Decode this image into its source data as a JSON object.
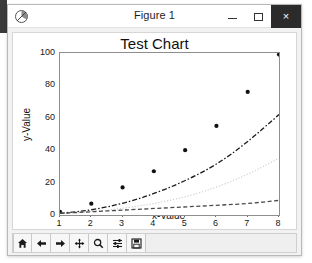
{
  "window": {
    "title": "Figure 1",
    "app_icon": "matplotlib-icon",
    "minimize_label": "",
    "maximize_label": "",
    "close_label": "×"
  },
  "toolbar": {
    "buttons": [
      {
        "name": "home-button",
        "icon": "home-icon",
        "tooltip": "Home"
      },
      {
        "name": "back-button",
        "icon": "arrow-left-icon",
        "tooltip": "Back"
      },
      {
        "name": "forward-button",
        "icon": "arrow-right-icon",
        "tooltip": "Forward"
      },
      {
        "name": "pan-button",
        "icon": "move-icon",
        "tooltip": "Pan"
      },
      {
        "name": "zoom-button",
        "icon": "magnifier-icon",
        "tooltip": "Zoom"
      },
      {
        "name": "configure-subplots-button",
        "icon": "sliders-icon",
        "tooltip": "Configure subplots"
      },
      {
        "name": "save-button",
        "icon": "floppy-disk-icon",
        "tooltip": "Save"
      }
    ]
  },
  "chart_data": {
    "type": "scatter",
    "title": "Test Chart",
    "xlabel": "x-Value",
    "ylabel": "y-Value",
    "xlim": [
      1,
      8
    ],
    "ylim": [
      0,
      100
    ],
    "xticks": [
      1,
      2,
      3,
      4,
      5,
      6,
      7,
      8
    ],
    "yticks": [
      0,
      20,
      40,
      60,
      80,
      100
    ],
    "grid": false,
    "legend": null,
    "x": [
      1,
      2,
      3,
      4,
      5,
      6,
      7,
      8
    ],
    "series": [
      {
        "name": "data points",
        "kind": "scatter",
        "marker": "o",
        "color": "#111111",
        "values": [
          2,
          7,
          17,
          27,
          40,
          55,
          76,
          99
        ]
      },
      {
        "name": "fit-quadratic",
        "kind": "line",
        "linestyle": "dashdot",
        "color": "#1a1a1a",
        "values": [
          1,
          3,
          7,
          13,
          21,
          31,
          45,
          62
        ]
      },
      {
        "name": "fit-mid",
        "kind": "line",
        "linestyle": "dotted",
        "color": "#b4b4b4",
        "values": [
          1,
          2,
          4,
          7,
          11,
          17,
          25,
          35
        ]
      },
      {
        "name": "fit-linear",
        "kind": "line",
        "linestyle": "dashed",
        "color": "#4a4a4a",
        "values": [
          1,
          2,
          3,
          4,
          5,
          6,
          7,
          9
        ]
      }
    ]
  }
}
